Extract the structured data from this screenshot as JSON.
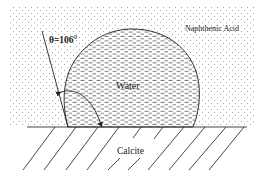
{
  "diagram": {
    "type": "contact-angle-schematic",
    "labels": {
      "angle": "θ=106°",
      "droplet": "Water",
      "surrounding_phase": "Naphthenic Acid",
      "substrate": "Calcite"
    },
    "angle_degrees": 106,
    "colors": {
      "line": "#333333",
      "dots": "#9a9a9a",
      "dashes": "#6a6a6a",
      "background": "#ffffff"
    }
  }
}
